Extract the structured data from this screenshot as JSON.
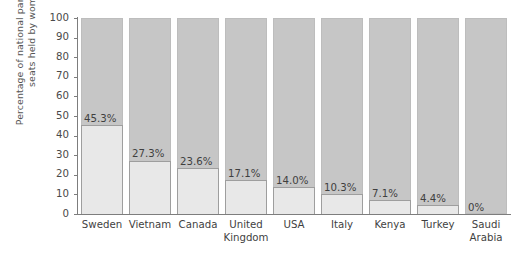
{
  "chart_data": {
    "type": "bar",
    "title": "",
    "subtitle": "",
    "xlabel": "",
    "ylabel": "Percentage of national parliamentary seats held by women",
    "ylim": [
      0,
      100
    ],
    "yticks": [
      100,
      90,
      80,
      70,
      60,
      50,
      40,
      30,
      20,
      10,
      0
    ],
    "grid": false,
    "legend": "none",
    "stacked": true,
    "categories": [
      "Sweden",
      "Vietnam",
      "Canada",
      "United Kingdom",
      "USA",
      "Italy",
      "Kenya",
      "Turkey",
      "Saudi Arabia"
    ],
    "category_display": [
      "Sweden",
      "Vietnam",
      "Canada",
      "United\nKingdom",
      "USA",
      "Italy",
      "Kenya",
      "Turkey",
      "Saudi\nArabia"
    ],
    "values": [
      45.3,
      27.3,
      23.6,
      17.1,
      14.0,
      10.3,
      7.1,
      4.4,
      0
    ],
    "value_labels": [
      "45.3%",
      "27.3%",
      "23.6%",
      "17.1%",
      "14.0%",
      "10.3%",
      "7.1%",
      "4.4%",
      "0%"
    ],
    "series": [
      {
        "name": "Seats held by women",
        "values": [
          45.3,
          27.3,
          23.6,
          17.1,
          14.0,
          10.3,
          7.1,
          4.4,
          0
        ],
        "color": "#e8e8e8"
      },
      {
        "name": "Remaining seats",
        "values": [
          54.7,
          72.7,
          76.4,
          82.9,
          86.0,
          89.7,
          92.9,
          95.6,
          100
        ],
        "color": "#c6c6c6"
      }
    ],
    "colors": {
      "fill": "#e8e8e8",
      "remainder": "#c6c6c6",
      "axis": "#7d7d7d",
      "text": "#3f3f3f",
      "background": "#ffffff"
    }
  }
}
